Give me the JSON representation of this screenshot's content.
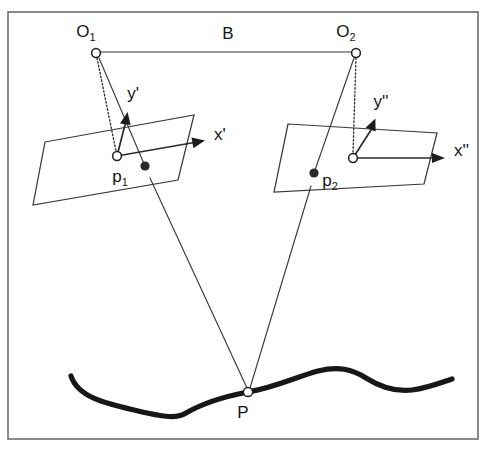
{
  "figure": {
    "title_text": "",
    "background_color": "#ffffff",
    "border_color": "#6d6d6d",
    "line_color": "#3a3a3a",
    "curve_color": "#171717"
  },
  "labels": {
    "camera_left": "O",
    "camera_left_sub": "1",
    "camera_right": "O",
    "camera_right_sub": "2",
    "baseline": "B",
    "image_point_left": "p",
    "image_point_left_sub": "1",
    "image_point_right": "p",
    "image_point_right_sub": "2",
    "axis_x_left": "x'",
    "axis_y_left": "y'",
    "axis_x_right": "x''",
    "axis_y_right": "y''",
    "scene_point": "P"
  },
  "geometry": {
    "frame": {
      "x": 8,
      "y": 12,
      "width": 470,
      "height": 427
    },
    "camera_left_center": {
      "cx": 96,
      "cy": 53,
      "r": 4.4
    },
    "camera_right_center": {
      "cx": 356,
      "cy": 53,
      "r": 4.4
    },
    "baseline_segment": {
      "x1": 100,
      "y1": 52,
      "x2": 352,
      "y2": 52
    },
    "principal_point_left": {
      "cx": 117,
      "cy": 156,
      "r": 4.4
    },
    "principal_point_right": {
      "cx": 353,
      "cy": 158,
      "r": 4.4
    },
    "image_dot_left": {
      "cx": 145,
      "cy": 166,
      "r": 4.6
    },
    "image_dot_right": {
      "cx": 314,
      "cy": 173,
      "r": 4.6
    },
    "scene_point": {
      "cx": 248,
      "cy": 392,
      "r": 4.6
    },
    "plane_left": "45,142 194,115 178,180 33,205",
    "plane_right": "288,124 437,133 424,184 274,192",
    "axis_y_left_tip": {
      "x": 127,
      "y": 112
    },
    "axis_x_left_tip": {
      "x": 205,
      "y": 142
    },
    "axis_y_right_tip": {
      "x": 375,
      "y": 118
    },
    "axis_x_right_tip": {
      "x": 445,
      "y": 158
    }
  },
  "label_positions": {
    "camera_left": {
      "x": 86,
      "y": 33
    },
    "camera_right": {
      "x": 346,
      "y": 33
    },
    "baseline": {
      "x": 228,
      "y": 35
    },
    "axis_y_left": {
      "x": 133,
      "y": 95
    },
    "axis_x_left": {
      "x": 214,
      "y": 136
    },
    "axis_y_right": {
      "x": 381,
      "y": 103
    },
    "axis_x_right": {
      "x": 454,
      "y": 152
    },
    "image_point_left": {
      "x": 120,
      "y": 178
    },
    "image_point_right": {
      "x": 330,
      "y": 182
    },
    "scene_point": {
      "x": 243,
      "y": 414
    }
  }
}
